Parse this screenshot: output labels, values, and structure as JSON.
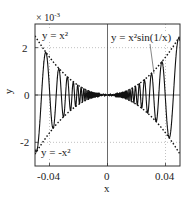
{
  "chart_data": {
    "type": "line",
    "title": "",
    "xlabel": "x",
    "ylabel": "y",
    "y_multiplier": "× 10^-3",
    "xlim": [
      -0.05,
      0.05
    ],
    "ylim": [
      -0.003,
      0.003
    ],
    "x_ticks": [
      -0.04,
      0,
      0.04
    ],
    "x_tick_labels": [
      "-0.04",
      "0",
      "0.04"
    ],
    "y_ticks": [
      -2,
      0,
      2
    ],
    "y_tick_labels": [
      "-2",
      "0",
      "2"
    ],
    "grid": true,
    "series": [
      {
        "name": "y = x^2 sin(1/x)",
        "style": "solid",
        "function": "x^2*sin(1/x)"
      },
      {
        "name": "y = x^2",
        "style": "dotted",
        "function": "x^2"
      },
      {
        "name": "y = -x^2",
        "style": "dotted",
        "function": "-x^2"
      }
    ],
    "annotations": [
      {
        "text": "y = x²",
        "position": "upper-left"
      },
      {
        "text": "y = -x²",
        "position": "lower-left"
      },
      {
        "text": "y = x²sin(1/x)",
        "position": "upper-right",
        "arrow_to": [
          0.03,
          0.0009
        ]
      }
    ]
  },
  "labels": {
    "multiplier": "× 10",
    "multiplier_exp": "-3",
    "xlabel": "x",
    "ylabel": "y",
    "ann_xsq": "y = x²",
    "ann_negxsq": "y = -x²",
    "ann_main": "y = x²sin(1/x)",
    "xt0": "-0.04",
    "xt1": "0",
    "xt2": "0.04",
    "yt0": "2",
    "yt1": "0",
    "yt2": "-2"
  }
}
